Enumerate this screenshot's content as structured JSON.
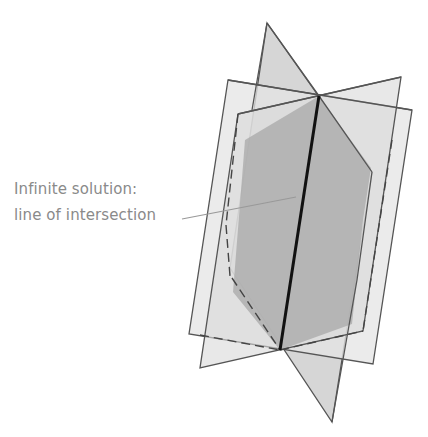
{
  "diagram": {
    "label": {
      "line1": "Infinite solution:",
      "line2": "line of intersection"
    },
    "colors": {
      "plane_light": "#e6e6e6",
      "plane_mid": "#cfcfcf",
      "overlap_dark": "#a9a9a9",
      "edge": "#555555",
      "intersection_line": "#111111",
      "label_text": "#8a8a8a",
      "leader_line": "#999999"
    },
    "planes": [
      {
        "name": "plane-outer",
        "points": [
          [
            228,
            80
          ],
          [
            412,
            110
          ],
          [
            373,
            364
          ],
          [
            189,
            334
          ]
        ]
      },
      {
        "name": "plane-inner",
        "points": [
          [
            238,
            114
          ],
          [
            401,
            77
          ],
          [
            363,
            331
          ],
          [
            200,
            368
          ]
        ]
      },
      {
        "name": "plane-kite",
        "points": [
          [
            267,
            23
          ],
          [
            372,
            172
          ],
          [
            332,
            422
          ],
          [
            230,
            268
          ]
        ]
      }
    ],
    "intersection_line": {
      "from": [
        319,
        96
      ],
      "to": [
        280,
        350
      ]
    },
    "leader_line": {
      "from": [
        182,
        219
      ],
      "to": [
        296,
        197
      ]
    }
  }
}
